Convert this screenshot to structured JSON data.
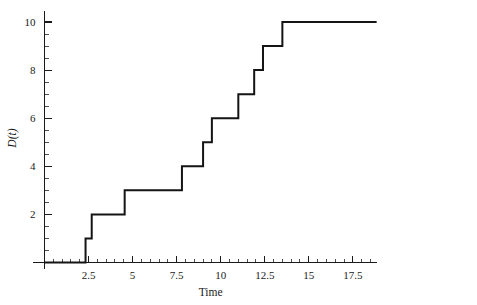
{
  "chart_data": {
    "type": "line",
    "subtype": "step-post",
    "title": "",
    "xlabel": "Time",
    "ylabel": "D(t)",
    "xlim": [
      0,
      18.85
    ],
    "ylim": [
      0,
      10.35
    ],
    "grid": false,
    "legend": null,
    "line_color": "#141414",
    "axis_color": "#1a1a1a",
    "background": "#ffffff",
    "x_ticks_major": [
      2.5,
      5,
      7.5,
      10,
      12.5,
      15,
      17.5
    ],
    "x_tick_labels": [
      "2.5",
      "5",
      "7.5",
      "10",
      "12.5",
      "15",
      "17.5"
    ],
    "x_ticks_minor": [
      0.5,
      1,
      1.5,
      2,
      3,
      3.5,
      4,
      4.5,
      5.5,
      6,
      6.5,
      7,
      8,
      8.5,
      9,
      9.5,
      10.5,
      11,
      11.5,
      12,
      13,
      13.5,
      14,
      14.5,
      15.5,
      16,
      16.5,
      17,
      18,
      18.5
    ],
    "y_ticks_major": [
      2,
      4,
      6,
      8,
      10
    ],
    "y_tick_labels": [
      "2",
      "4",
      "6",
      "8",
      "10"
    ],
    "y_ticks_minor": [
      0.5,
      1,
      1.5,
      2.5,
      3,
      3.5,
      4.5,
      5,
      5.5,
      6.5,
      7,
      7.5,
      8.5,
      9,
      9.5
    ],
    "jump_times": [
      2.33,
      2.68,
      4.55,
      7.8,
      9.0,
      9.5,
      11.0,
      11.9,
      12.4,
      13.5
    ],
    "jump_values": [
      1,
      2,
      3,
      4,
      5,
      6,
      7,
      8,
      9,
      10
    ],
    "start_point": [
      0,
      0
    ],
    "end_point": [
      18.85,
      10
    ],
    "points": [
      {
        "t": 0.0,
        "d": 0
      },
      {
        "t": 2.33,
        "d": 1
      },
      {
        "t": 2.68,
        "d": 2
      },
      {
        "t": 4.55,
        "d": 3
      },
      {
        "t": 7.8,
        "d": 4
      },
      {
        "t": 9.0,
        "d": 5
      },
      {
        "t": 9.5,
        "d": 6
      },
      {
        "t": 11.0,
        "d": 7
      },
      {
        "t": 11.9,
        "d": 8
      },
      {
        "t": 12.4,
        "d": 9
      },
      {
        "t": 13.5,
        "d": 10
      },
      {
        "t": 18.85,
        "d": 10
      }
    ]
  }
}
